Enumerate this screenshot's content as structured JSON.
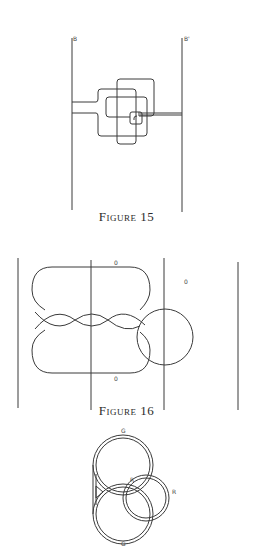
{
  "figures": [
    {
      "id": "figure-15",
      "caption": "Figure 15",
      "labels": {
        "left_line": "B",
        "right_line": "B'"
      }
    },
    {
      "id": "figure-16",
      "caption": "Figure 16",
      "labels": {
        "top": "0",
        "bottom": "0",
        "circle": "0"
      }
    },
    {
      "id": "figure-17",
      "labels": {
        "top": "G",
        "bottom": "G",
        "inner": "R",
        "outer": "R"
      }
    }
  ]
}
